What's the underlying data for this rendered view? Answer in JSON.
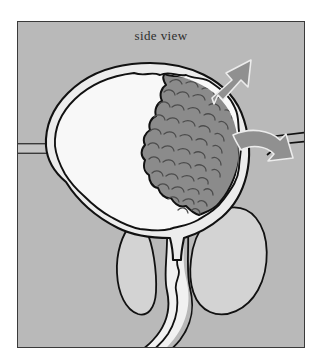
{
  "figure": {
    "caption": "side view",
    "domain_subject": "bladder-with-tumor-anatomical-diagram",
    "frame": {
      "x": 17,
      "y": 21,
      "width": 288,
      "height": 327
    }
  },
  "colors": {
    "page_background": "#ffffff",
    "panel_background": "#b9b9b9",
    "frame_border": "#3a3a3a",
    "outline_stroke": "#111111",
    "bladder_lumen_fill": "#f7f7f7",
    "bladder_wall_fill": "#ededed",
    "tumor_fill": "#8a8a8a",
    "tumor_texture": "#4a4a4a",
    "organ_fill": "#d2d2d2",
    "urethra_fill": "#efefef",
    "arrow_fill": "#8f8f8f",
    "arrow_stroke": "#e9e9e9",
    "caption_text": "#2e2e2e"
  },
  "labels": {
    "caption_text": "side view"
  },
  "parts": [
    {
      "name": "bladder-outer-wall",
      "description": "smooth outer detrusor contour of the urinary bladder"
    },
    {
      "name": "bladder-inner-mucosa",
      "description": "scalloped inner mucosal lining of the bladder"
    },
    {
      "name": "bladder-lumen",
      "description": "white urine-filled cavity"
    },
    {
      "name": "bladder-tumor",
      "description": "gray cauliflower-like papillary tumor on the right posterior bladder wall"
    },
    {
      "name": "left-ureter",
      "description": "tube entering bladder from the left edge"
    },
    {
      "name": "right-ureter",
      "description": "tube entering bladder from the right edge"
    },
    {
      "name": "bladder-neck",
      "description": "funnel narrowing into the urethra"
    },
    {
      "name": "urethra",
      "description": "channel running down and curving left out of frame"
    },
    {
      "name": "prostate-anterior-lobe",
      "description": "small rounded organ to the left of the urethra"
    },
    {
      "name": "posterior-organ",
      "description": "large teardrop organ to the right of the urethra"
    },
    {
      "name": "arrow-upper",
      "description": "straight arrow pointing up and to the right"
    },
    {
      "name": "arrow-lower",
      "description": "curved arrow pointing down and to the right"
    }
  ],
  "arrows": [
    {
      "id": "arrow-upper",
      "direction": "up-right",
      "style": "straight"
    },
    {
      "id": "arrow-lower",
      "direction": "right-down",
      "style": "curved"
    }
  ]
}
